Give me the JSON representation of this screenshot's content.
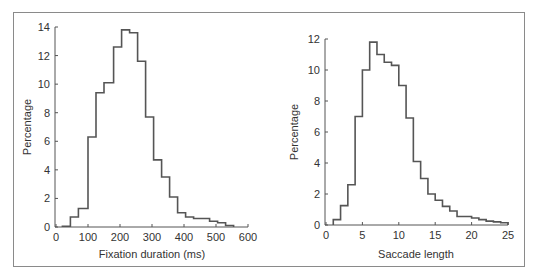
{
  "figure": {
    "style": {
      "line_color": "#555555",
      "axis_color": "#555555",
      "frame_color": "#8a8a8a",
      "text_color": "#333333"
    }
  },
  "chart_data": [
    {
      "type": "bar",
      "subtype": "histogram-step",
      "title": "",
      "xlabel": "Fixation duration (ms)",
      "ylabel": "Percentage",
      "xlim": [
        0,
        600
      ],
      "ylim": [
        0,
        14
      ],
      "xticks": [
        0,
        100,
        200,
        300,
        400,
        500,
        600
      ],
      "yticks": [
        0,
        2,
        4,
        6,
        8,
        10,
        12,
        14
      ],
      "xtick_labels": [
        "0",
        "100",
        "200",
        "300",
        "400",
        "500",
        "600"
      ],
      "ytick_labels": [
        "0",
        "2",
        "4",
        "6",
        "8",
        "10",
        "12",
        "14"
      ],
      "grid": false,
      "bin_edges": [
        20,
        45,
        70,
        100,
        125,
        150,
        180,
        205,
        230,
        255,
        280,
        305,
        330,
        355,
        380,
        405,
        430,
        455,
        480,
        505,
        530,
        555
      ],
      "values": [
        0.05,
        0.7,
        1.3,
        6.3,
        9.4,
        10.1,
        12.6,
        13.8,
        13.6,
        11.6,
        7.7,
        4.7,
        3.5,
        2.1,
        1.0,
        0.7,
        0.6,
        0.6,
        0.4,
        0.3,
        0.1
      ]
    },
    {
      "type": "bar",
      "subtype": "histogram-step",
      "title": "",
      "xlabel": "Saccade length",
      "ylabel": "Percentage",
      "xlim": [
        0,
        25
      ],
      "ylim": [
        0,
        12
      ],
      "xticks": [
        0,
        5,
        10,
        15,
        20,
        25
      ],
      "yticks": [
        0,
        2,
        4,
        6,
        8,
        10,
        12
      ],
      "xtick_labels": [
        "0",
        "5",
        "10",
        "15",
        "20",
        "25"
      ],
      "ytick_labels": [
        "0",
        "2",
        "4",
        "6",
        "8",
        "10",
        "12"
      ],
      "grid": false,
      "bin_edges": [
        1,
        2,
        3,
        4,
        5,
        6,
        7,
        8,
        9,
        10,
        11,
        12,
        13,
        14,
        15,
        16,
        17,
        18,
        19,
        20,
        21,
        22,
        23,
        24,
        25
      ],
      "values": [
        0.35,
        1.25,
        2.6,
        7.0,
        10.0,
        11.8,
        11.0,
        10.5,
        10.3,
        9.0,
        6.9,
        4.1,
        3.0,
        2.0,
        1.6,
        1.2,
        0.9,
        0.55,
        0.55,
        0.45,
        0.35,
        0.25,
        0.2,
        0.15
      ]
    }
  ]
}
